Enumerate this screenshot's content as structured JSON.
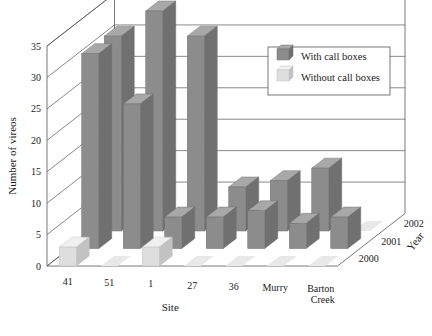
{
  "chart_data": {
    "type": "bar",
    "title": "",
    "xlabel": "Site",
    "ylabel": "Number of vireos",
    "zlabel": "Year",
    "ylim": [
      0,
      35
    ],
    "yticks": [
      0,
      5,
      10,
      15,
      20,
      25,
      30,
      35
    ],
    "grid": true,
    "projection": "3d",
    "categories": [
      "41",
      "51",
      "1",
      "27",
      "36",
      "Murry",
      "Barton Creek"
    ],
    "depth_categories": [
      "2000",
      "2001",
      "2002"
    ],
    "legend": {
      "position": "top-right",
      "entries": [
        {
          "name": "With call boxes",
          "color": "#8c8c8c"
        },
        {
          "name": "Without call boxes",
          "color": "#dcdcdc"
        }
      ]
    },
    "series": [
      {
        "name": "2000",
        "depth": 0,
        "fill": "Without call boxes",
        "values": [
          3,
          0.3,
          3,
          0.3,
          0.3,
          0.3,
          0.3
        ]
      },
      {
        "name": "2001",
        "depth": 1,
        "fill": "With call boxes",
        "values": [
          31,
          23,
          5,
          5,
          6,
          4,
          5
        ]
      },
      {
        "name": "2002",
        "depth": 2,
        "fill": "With call boxes",
        "values": [
          31,
          35,
          31,
          7,
          8,
          10,
          0
        ]
      }
    ],
    "bar_colors": {
      "with_call_boxes": "#8c8c8c",
      "without_call_boxes": "#dcdcdc",
      "with_call_boxes_top": "#a8a8a8",
      "with_call_boxes_side": "#6f6f6f",
      "without_call_boxes_top": "#efefef",
      "without_call_boxes_side": "#c4c4c4"
    },
    "notes": [
      "Site 51 year-2002 bar is the tallest light bar at 35",
      "Sites 41, 1 and 51 carry the tall dark bars around 31, 23 and 31",
      "Front row (2000) bars are mostly flat near zero except sites 41 and 1"
    ]
  },
  "axes": {
    "y_title": "Number of vireos",
    "x_title": "Site",
    "z_title": "Year",
    "y_ticks": [
      "0",
      "5",
      "10",
      "15",
      "20",
      "25",
      "30",
      "35"
    ],
    "x_ticks": [
      "41",
      "51",
      "1",
      "27",
      "36",
      "Murry",
      "Barton Creek"
    ],
    "z_ticks": [
      "2000",
      "2001",
      "2002"
    ]
  },
  "legend": {
    "item_with": "With call boxes",
    "item_without": "Without call boxes"
  },
  "colors": {
    "frame": "#555555",
    "grid": "#555555",
    "dark_front": "#8c8c8c",
    "dark_top": "#a8a8a8",
    "dark_side": "#707070",
    "light_front": "#dedede",
    "light_top": "#f0f0f0",
    "light_side": "#c2c2c2",
    "shadow": "#e8e8e8",
    "background": "#ffffff"
  }
}
